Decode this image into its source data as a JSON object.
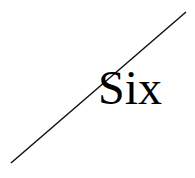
{
  "canvas": {
    "width": 195,
    "height": 178,
    "background_color": "#ffffff"
  },
  "figure": {
    "label_text": "Six",
    "label_color": "#000000",
    "line": {
      "name": "diagonal-line",
      "color": "#111111",
      "stroke_width": 1.5,
      "x1": 11,
      "y1": 163,
      "x2": 186,
      "y2": 12
    }
  }
}
